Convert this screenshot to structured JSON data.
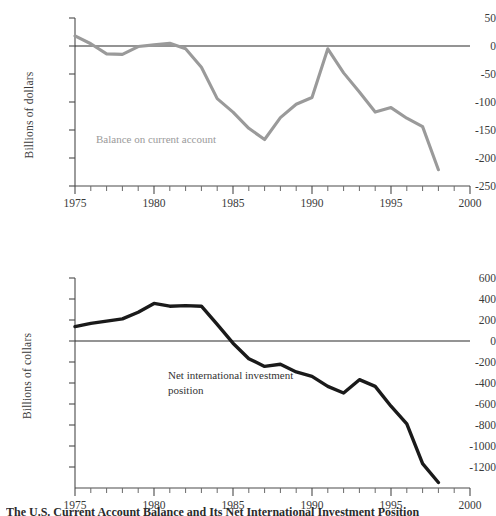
{
  "figure": {
    "caption": "The U.S. Current Account Balance and Its Net International Investment Position"
  },
  "panels": [
    {
      "id": "current-account",
      "ylabel": "Billions of dollars",
      "series_label": "Balance on current account",
      "series_color": "#9a9a9a",
      "y_ticks": [
        "50",
        "0",
        "-50",
        "-100",
        "-150",
        "-200",
        "-250"
      ],
      "x_ticks": [
        "1975",
        "1980",
        "1985",
        "1990",
        "1995",
        "2000"
      ]
    },
    {
      "id": "net-investment-position",
      "ylabel": "Billions of collars",
      "series_label": "Net international investment\nposition",
      "series_color": "#1a1a1a",
      "y_ticks": [
        "600",
        "400",
        "200",
        "0",
        "-200",
        "-400",
        "-600",
        "-800",
        "-1000",
        "-1200"
      ],
      "x_ticks": [
        "1975",
        "1980",
        "1985",
        "1990",
        "1995",
        "2000"
      ]
    }
  ],
  "chart_data": [
    {
      "type": "line",
      "title": "",
      "xlabel": "",
      "ylabel": "Billions of dollars",
      "series_name": "Balance on current account",
      "xlim": [
        1975,
        2000
      ],
      "ylim": [
        -250,
        50
      ],
      "xticks": [
        1975,
        1980,
        1985,
        1990,
        1995,
        2000
      ],
      "yticks": [
        50,
        0,
        -50,
        -100,
        -150,
        -200,
        -250
      ],
      "grid": false,
      "legend": "inline-annotation",
      "zero_line": true,
      "x": [
        1975,
        1976,
        1977,
        1978,
        1979,
        1980,
        1981,
        1982,
        1983,
        1984,
        1985,
        1986,
        1987,
        1988,
        1989,
        1990,
        1991,
        1992,
        1993,
        1994,
        1995,
        1996,
        1997,
        1998
      ],
      "values": [
        18,
        4,
        -14,
        -15,
        -1,
        2,
        5,
        -5,
        -38,
        -94,
        -118,
        -147,
        -167,
        -128,
        -104,
        -92,
        -5,
        -48,
        -82,
        -118,
        -110,
        -129,
        -144,
        -221
      ]
    },
    {
      "type": "line",
      "title": "",
      "xlabel": "",
      "ylabel": "Billions of collars",
      "series_name": "Net international investment position",
      "xlim": [
        1975,
        2000
      ],
      "ylim": [
        -1300,
        600
      ],
      "xticks": [
        1975,
        1980,
        1985,
        1990,
        1995,
        2000
      ],
      "yticks": [
        600,
        400,
        200,
        0,
        -200,
        -400,
        -600,
        -800,
        -1000,
        -1200
      ],
      "grid": false,
      "legend": "inline-annotation",
      "zero_line": true,
      "x": [
        1975,
        1976,
        1977,
        1978,
        1979,
        1980,
        1981,
        1982,
        1983,
        1984,
        1985,
        1986,
        1987,
        1988,
        1989,
        1990,
        1991,
        1992,
        1993,
        1994,
        1995,
        1996,
        1997,
        1998
      ],
      "values": [
        160,
        190,
        210,
        230,
        290,
        370,
        345,
        350,
        345,
        180,
        10,
        -130,
        -200,
        -180,
        -250,
        -290,
        -380,
        -440,
        -320,
        -380,
        -560,
        -720,
        -1080,
        -1250
      ]
    }
  ]
}
